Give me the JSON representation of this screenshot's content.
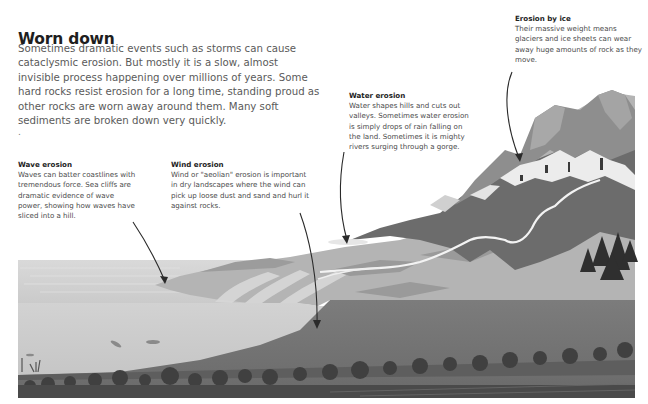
{
  "page": {
    "title": "Worn down",
    "intro": "Sometimes dramatic events such as storms can cause cataclysmic erosion. But mostly it is a slow, almost invisible process happening over millions of years. Some hard rocks resist erosion for a long time, standing proud as other rocks are worn away around them. Many soft sediments are broken down very quickly.",
    "intro_trailing": "."
  },
  "callouts": [
    {
      "id": "wave",
      "title": "Wave erosion",
      "body": "Waves can batter coastlines with tremendous force. Sea cliffs are dramatic evidence of wave power, showing how waves have sliced into a hill."
    },
    {
      "id": "wind",
      "title": "Wind erosion",
      "body": "Wind or \"aeolian\" erosion is important in dry landscapes where the wind can pick up loose dust and sand and hurl it against rocks."
    },
    {
      "id": "water",
      "title": "Water erosion",
      "body": "Water shapes hills and cuts out valleys. Sometimes water erosion is simply drops of rain falling on the land. Sometimes it is mighty rivers surging through a gorge."
    },
    {
      "id": "ice",
      "title": "Erosion by ice",
      "body": "Their massive weight means glaciers and ice sheets can wear away huge amounts of rock as they move."
    }
  ],
  "illustration": {
    "subject": "landscape-cross-section-erosion",
    "palette": {
      "sky": "#ffffff",
      "sea_surface": "#d4d4d4",
      "sea_underwater": "#c9c9c9",
      "land_light": "#b8b8b8",
      "land_mid": "#9a9a9a",
      "land_dark": "#6e6e6e",
      "mountain_rock": "#7a7a7a",
      "snow": "#ededed",
      "river": "#f2f2f2",
      "seabed": "#5a5a5a",
      "trees": "#3c3c3c",
      "arrow": "#2a2a2a"
    }
  }
}
